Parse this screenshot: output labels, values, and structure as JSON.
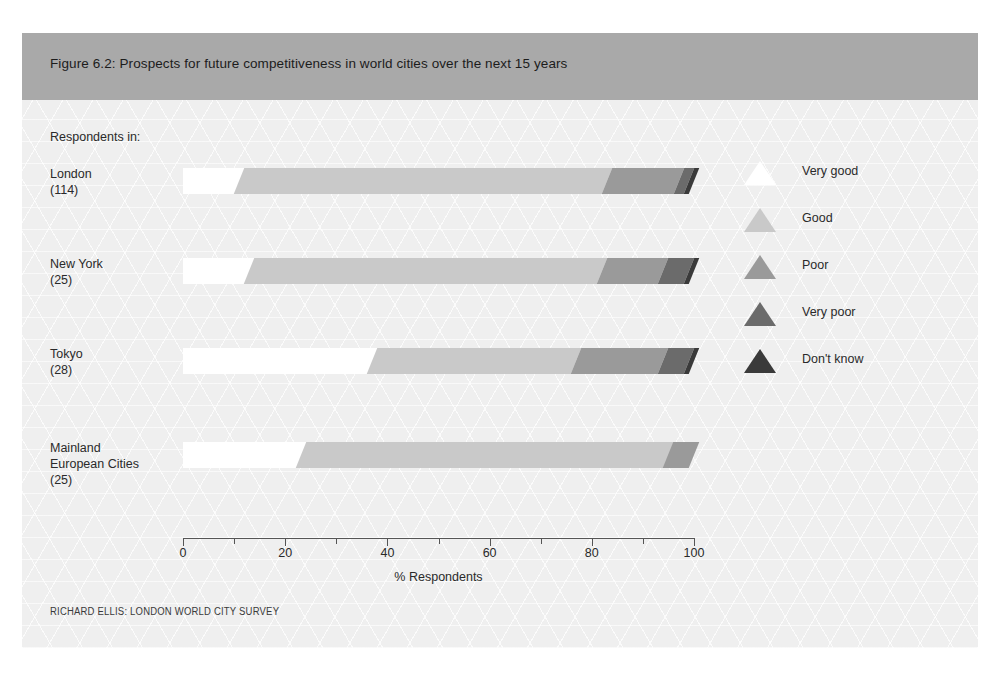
{
  "figure": {
    "title": "Figure 6.2: Prospects for future competitiveness in world cities over the next 15 years",
    "respondents_label": "Respondents in:",
    "source": "RICHARD ELLIS: LONDON WORLD CITY SURVEY",
    "header_color": "#a9a9a9",
    "background_color": "#efefef"
  },
  "chart_data": {
    "type": "bar",
    "orientation": "horizontal",
    "stacked": true,
    "title": "Figure 6.2: Prospects for future competitiveness in world cities over the next 15 years",
    "xlabel": "% Respondents",
    "ylabel": "",
    "xlim": [
      0,
      100
    ],
    "xticks": [
      0,
      10,
      20,
      30,
      40,
      50,
      60,
      70,
      80,
      90,
      100
    ],
    "xtick_labels": [
      "0",
      "",
      "20",
      "",
      "40",
      "",
      "60",
      "",
      "80",
      "",
      "100"
    ],
    "grid": false,
    "legend_position": "right",
    "categories": [
      "London",
      "New York",
      "Tokyo",
      "Mainland European Cities"
    ],
    "category_counts": [
      "(114)",
      "(25)",
      "(28)",
      "(25)"
    ],
    "category_lines": [
      [
        "London",
        "(114)"
      ],
      [
        "New York",
        "(25)"
      ],
      [
        "Tokyo",
        "(28)"
      ],
      [
        "Mainland",
        "European Cities",
        "(25)"
      ]
    ],
    "series": [
      {
        "name": "Very good",
        "color": "#ffffff",
        "values": [
          11,
          13,
          37,
          23
        ]
      },
      {
        "name": "Good",
        "color": "#c9c9c9",
        "values": [
          72,
          69,
          40,
          72
        ]
      },
      {
        "name": "Poor",
        "color": "#9a9a9a",
        "values": [
          14,
          12,
          17,
          5
        ]
      },
      {
        "name": "Very poor",
        "color": "#6b6b6b",
        "values": [
          2,
          5,
          5,
          0
        ]
      },
      {
        "name": "Don't know",
        "color": "#3a3a3a",
        "values": [
          1,
          1,
          1,
          0
        ]
      }
    ],
    "legend_entries": [
      {
        "label": "Very good",
        "color": "#ffffff"
      },
      {
        "label": "Good",
        "color": "#c9c9c9"
      },
      {
        "label": "Poor",
        "color": "#9a9a9a"
      },
      {
        "label": "Very poor",
        "color": "#6b6b6b"
      },
      {
        "label": "Don't know",
        "color": "#3a3a3a"
      }
    ],
    "source": "RICHARD ELLIS: LONDON WORLD CITY SURVEY"
  }
}
